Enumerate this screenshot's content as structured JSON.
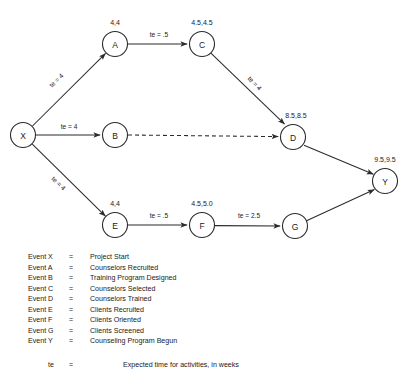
{
  "diagram": {
    "nodes": [
      {
        "id": "X",
        "label": "X",
        "time": "",
        "cx": 23,
        "cy": 135,
        "r": 12.5
      },
      {
        "id": "A",
        "label": "A",
        "time": "4,4",
        "cx": 115,
        "cy": 44,
        "r": 12.5
      },
      {
        "id": "B",
        "label": "B",
        "time": "",
        "cx": 115,
        "cy": 135,
        "r": 12.5
      },
      {
        "id": "C",
        "label": "C",
        "time": "4.5,4.5",
        "cx": 202,
        "cy": 44,
        "r": 12.5
      },
      {
        "id": "D",
        "label": "D",
        "time": "8.5,8.5",
        "cx": 293,
        "cy": 137,
        "r": 12.5
      },
      {
        "id": "E",
        "label": "E",
        "time": "4,4",
        "cx": 115,
        "cy": 225,
        "r": 12.5
      },
      {
        "id": "F",
        "label": "F",
        "time": "4.5,5.0",
        "cx": 202,
        "cy": 225,
        "r": 12.5
      },
      {
        "id": "G",
        "label": "G",
        "time": "",
        "cx": 295,
        "cy": 226,
        "r": 12.5
      },
      {
        "id": "Y",
        "label": "Y",
        "time": "9.5,9.5",
        "cx": 385,
        "cy": 181,
        "r": 12.5
      }
    ],
    "edges": [
      {
        "from": "X",
        "to": "A",
        "label": "te = 4",
        "style": "solid",
        "lx": 58,
        "ly": 82,
        "rot": -44
      },
      {
        "from": "X",
        "to": "B",
        "label": "te = 4",
        "style": "solid",
        "lx": 69,
        "ly": 129,
        "rot": 0
      },
      {
        "from": "X",
        "to": "E",
        "label": "te = 4",
        "style": "solid",
        "lx": 57,
        "ly": 185,
        "rot": 44
      },
      {
        "from": "A",
        "to": "C",
        "label": "te = .5",
        "style": "solid",
        "lx": 159,
        "ly": 37,
        "rot": 0
      },
      {
        "from": "C",
        "to": "D",
        "label": "te = 4",
        "style": "solid",
        "lx": 253,
        "ly": 85,
        "rot": 46
      },
      {
        "from": "B",
        "to": "D",
        "label": "",
        "style": "dashed",
        "lx": 0,
        "ly": 0,
        "rot": 0
      },
      {
        "from": "E",
        "to": "F",
        "label": "te = .5",
        "style": "solid",
        "lx": 159,
        "ly": 218,
        "rot": 0
      },
      {
        "from": "F",
        "to": "G",
        "label": "te = 2.5",
        "style": "solid",
        "lx": 249,
        "ly": 218,
        "rot": 0
      },
      {
        "from": "D",
        "to": "Y",
        "label": "",
        "style": "solid",
        "lx": 0,
        "ly": 0,
        "rot": 0
      },
      {
        "from": "G",
        "to": "Y",
        "label": "",
        "style": "solid",
        "lx": 0,
        "ly": 0,
        "rot": 0
      }
    ]
  },
  "legend": {
    "equals": "=",
    "rows": [
      {
        "key": "Event X",
        "desc": "Project Start"
      },
      {
        "key": "Event A",
        "desc": "Counselors Recruited"
      },
      {
        "key": "Event B",
        "desc": "Training Program Designed"
      },
      {
        "key": "Event C",
        "desc": "Counselors Selected"
      },
      {
        "key": "Event D",
        "desc": "Counselors Trained"
      },
      {
        "key": "Event E",
        "desc": "Clients Recruited"
      },
      {
        "key": "Event F",
        "desc": "Clients Oriented"
      },
      {
        "key": "Event G",
        "desc": "Clients Screened"
      },
      {
        "key": "Event Y",
        "desc": "Counseling Program Begun"
      }
    ]
  },
  "footnote": {
    "key": "te",
    "equals": "=",
    "desc": "Expected time for activities, in weeks"
  }
}
